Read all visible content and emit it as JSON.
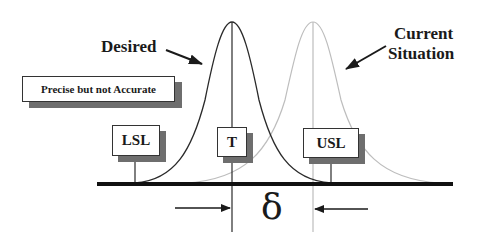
{
  "diagram": {
    "title_labels": {
      "desired": "Desired",
      "current_line1": "Current",
      "current_line2": "Situation"
    },
    "note_box": "Precise but not Accurate",
    "spec_boxes": {
      "lsl": "LSL",
      "target": "T",
      "usl": "USL"
    },
    "offset_symbol": "δ",
    "colors": {
      "desired_curve": "#2a2a2a",
      "current_curve": "#b8b8b8",
      "baseline": "#111111",
      "shadow": "#6e6e6e"
    },
    "curves": [
      {
        "name": "Desired",
        "center_x": 232,
        "peak_y": 22,
        "style": "solid dark"
      },
      {
        "name": "Current Situation",
        "center_x": 313,
        "peak_y": 22,
        "style": "light gray"
      }
    ]
  }
}
